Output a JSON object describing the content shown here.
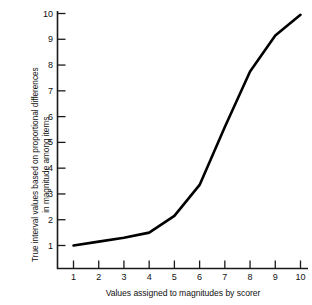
{
  "chart_data": {
    "type": "line",
    "title": "",
    "subtitle": "",
    "xlabel": "Values assigned to magnitudes by scorer",
    "ylabel_line1": "True interval values based on proportional differences",
    "ylabel_line2": "in magnitude among items",
    "x": [
      1,
      2,
      3,
      4,
      5,
      6,
      7,
      8,
      9,
      10
    ],
    "values": [
      1.0,
      1.15,
      1.3,
      1.5,
      2.15,
      3.35,
      5.6,
      7.75,
      9.15,
      9.95
    ],
    "series": [
      {
        "name": "True interval values",
        "values": [
          1.0,
          1.15,
          1.3,
          1.5,
          2.15,
          3.35,
          5.6,
          7.75,
          9.15,
          9.95
        ]
      }
    ],
    "xlim": [
      1,
      10
    ],
    "ylim": [
      1,
      10
    ],
    "xticks": [
      "1",
      "2",
      "3",
      "4",
      "5",
      "6",
      "7",
      "8",
      "9",
      "10"
    ],
    "yticks": [
      "1",
      "2",
      "3",
      "4",
      "5",
      "6",
      "7",
      "8",
      "9",
      "10"
    ],
    "grid": false,
    "legend": false,
    "legend_position": "none",
    "line_color": "#000000",
    "background_color": "#ffffff",
    "axis_color": "#1a1a1a"
  }
}
